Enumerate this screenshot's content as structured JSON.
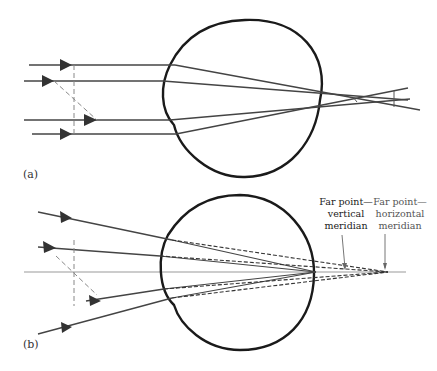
{
  "figure": {
    "panels": [
      {
        "id": "a",
        "label": "(a)"
      },
      {
        "id": "b",
        "label": "(b)"
      }
    ],
    "annotations": {
      "far_point_vertical": {
        "line1": "Far point—",
        "line2": "vertical",
        "line3": "meridian"
      },
      "far_point_horizontal": {
        "line1": "Far point—",
        "line2": "horizontal",
        "line3": "meridian"
      }
    },
    "colors": {
      "eye_outline": "#1a1a1a",
      "ray": "#444444",
      "dashed": "#888888",
      "axis": "#999999"
    }
  }
}
